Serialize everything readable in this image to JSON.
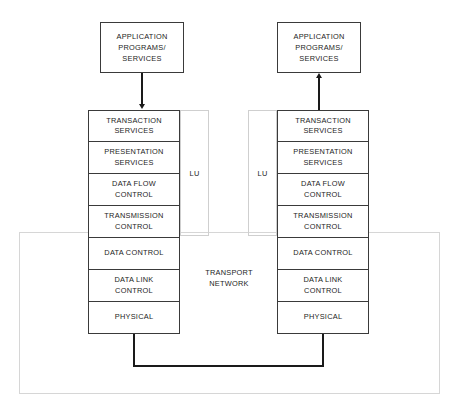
{
  "diagram": {
    "left_node": {
      "application_box": "APPLICATION\nPROGRAMS/\nSERVICES",
      "application_lines": [
        "APPLICATION",
        "PROGRAMS/",
        "SERVICES"
      ],
      "lu_label": "LU",
      "layers": [
        "TRANSACTION\nSERVICES",
        "PRESENTATION\nSERVICES",
        "DATA FLOW\nCONTROL",
        "TRANSMISSION\nCONTROL",
        "DATA CONTROL",
        "DATA LINK\nCONTROL",
        "PHYSICAL"
      ],
      "layer_lines": [
        [
          "TRANSACTION",
          "SERVICES"
        ],
        [
          "PRESENTATION",
          "SERVICES"
        ],
        [
          "DATA FLOW",
          "CONTROL"
        ],
        [
          "TRANSMISSION",
          "CONTROL"
        ],
        [
          "DATA CONTROL"
        ],
        [
          "DATA LINK",
          "CONTROL"
        ],
        [
          "PHYSICAL"
        ]
      ],
      "arrow_direction": "down"
    },
    "right_node": {
      "application_box": "APPLICATION\nPROGRAMS/\nSERVICES",
      "application_lines": [
        "APPLICATION",
        "PROGRAMS/",
        "SERVICES"
      ],
      "lu_label": "LU",
      "layers": [
        "TRANSACTION\nSERVICES",
        "PRESENTATION\nSERVICES",
        "DATA FLOW\nCONTROL",
        "TRANSMISSION\nCONTROL",
        "DATA CONTROL",
        "DATA LINK\nCONTROL",
        "PHYSICAL"
      ],
      "layer_lines": [
        [
          "TRANSACTION",
          "SERVICES"
        ],
        [
          "PRESENTATION",
          "SERVICES"
        ],
        [
          "DATA FLOW",
          "CONTROL"
        ],
        [
          "TRANSMISSION",
          "CONTROL"
        ],
        [
          "DATA CONTROL"
        ],
        [
          "DATA LINK",
          "CONTROL"
        ],
        [
          "PHYSICAL"
        ]
      ],
      "arrow_direction": "up"
    },
    "transport_network": {
      "label_lines": [
        "TRANSPORT",
        "NETWORK"
      ],
      "label": "TRANSPORT\nNETWORK"
    },
    "colors": {
      "line": "#3a3a3a",
      "faint_line": "#d6d6d6",
      "text": "#1d1d1d",
      "connector": "#1a1a1a",
      "background": "#ffffff"
    }
  }
}
